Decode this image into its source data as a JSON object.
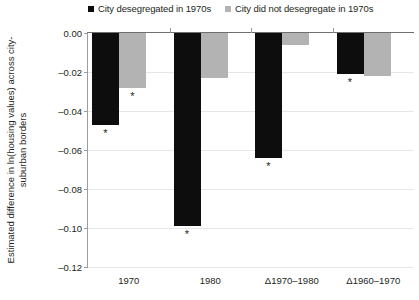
{
  "chart_data": {
    "type": "bar",
    "title": "",
    "xlabel": "",
    "ylabel": "Estimated difference in ln(housing values) across city-suburban borders",
    "categories": [
      "1970",
      "1980",
      "Δ1970–1980",
      "Δ1960–1970"
    ],
    "series": [
      {
        "name": "City desegregated in 1970s",
        "color": "#0d0d0d",
        "values": [
          -0.047,
          -0.099,
          -0.064,
          -0.021
        ],
        "significance": [
          "*",
          "*",
          "*",
          "*"
        ]
      },
      {
        "name": "City did not desegregate in 1970s",
        "color": "#b3b3b3",
        "values": [
          -0.028,
          -0.023,
          -0.006,
          -0.022
        ],
        "significance": [
          "*",
          "",
          "",
          ""
        ]
      }
    ],
    "ylim": [
      -0.12,
      0.0
    ],
    "yticks": [
      0.0,
      -0.02,
      -0.04,
      -0.06,
      -0.08,
      -0.1,
      -0.12
    ],
    "ytick_labels": [
      "0.00",
      "–0.02",
      "–0.04",
      "–0.06",
      "–0.08",
      "–0.10",
      "–0.12"
    ],
    "grid": true,
    "legend_position": "top"
  },
  "legend": {
    "items": [
      {
        "label": "City desegregated in 1970s",
        "color": "#0d0d0d",
        "marker": "square-marker"
      },
      {
        "label": "City did not desegregate in 1970s",
        "color": "#b3b3b3",
        "marker": "square-marker"
      }
    ]
  },
  "significance_note": {
    "symbol": "*"
  }
}
